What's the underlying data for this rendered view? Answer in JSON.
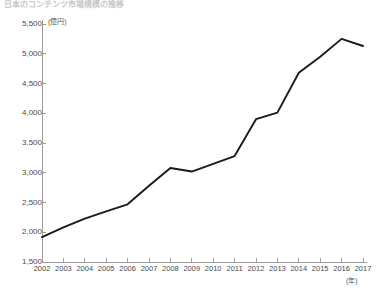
{
  "chart_data": {
    "type": "line",
    "title": "日本のコンテンツ市場規模の推移",
    "subtitle": "",
    "xlabel": "(年)",
    "ylabel": "(億円)",
    "x": [
      2002,
      2003,
      2004,
      2005,
      2006,
      2007,
      2008,
      2009,
      2010,
      2011,
      2012,
      2013,
      2014,
      2015,
      2016,
      2017
    ],
    "categories": [
      "2002",
      "2003",
      "2004",
      "2005",
      "2006",
      "2007",
      "2008",
      "2009",
      "2010",
      "2011",
      "2012",
      "2013",
      "2014",
      "2015",
      "2016",
      "2017"
    ],
    "values": [
      1920,
      2080,
      2230,
      2350,
      2470,
      2780,
      3080,
      3020,
      3150,
      3280,
      3900,
      4010,
      4680,
      4950,
      5250,
      5130
    ],
    "series": [
      {
        "name": "市場規模",
        "values": [
          1920,
          2080,
          2230,
          2350,
          2470,
          2780,
          3080,
          3020,
          3150,
          3280,
          3900,
          4010,
          4680,
          4950,
          5250,
          5130
        ],
        "color": "#1a1a1a"
      }
    ],
    "ylim": [
      1500,
      5500
    ],
    "ytick_values": [
      1500,
      2000,
      2500,
      3000,
      3500,
      4000,
      4500,
      5000,
      5500
    ],
    "ytick_labels": [
      "1,500",
      "2,000",
      "2,500",
      "3,000",
      "3,500",
      "4,000",
      "4,500",
      "5,000",
      "5,500"
    ],
    "xlim": [
      2002,
      2017
    ],
    "grid": false,
    "legend": false,
    "legend_position": "none"
  },
  "axes": {
    "y_unit": "(億円)",
    "x_unit": "(年)"
  },
  "colors": {
    "line": "#1a1a1a",
    "axis": "#9a9a9a",
    "text": "#4a4a4a",
    "background": "#ffffff"
  }
}
